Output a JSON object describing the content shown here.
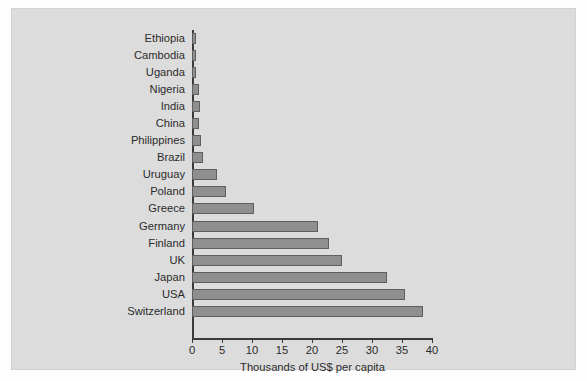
{
  "chart_data": {
    "type": "bar",
    "orientation": "horizontal",
    "title": "",
    "subtitle": "",
    "xlabel": "Thousands of US$ per capita",
    "ylabel": "",
    "xlim": [
      0,
      40
    ],
    "xticks": [
      0,
      5,
      10,
      15,
      20,
      25,
      30,
      35,
      40
    ],
    "xtick_labels": [
      "0",
      "5",
      "10",
      "15",
      "20",
      "25",
      "30",
      "35",
      "40"
    ],
    "grid": false,
    "legend": null,
    "categories": [
      "Ethiopia",
      "Cambodia",
      "Uganda",
      "Nigeria",
      "India",
      "China",
      "Philippines",
      "Brazil",
      "Uruguay",
      "Poland",
      "Greece",
      "Germany",
      "Finland",
      "UK",
      "Japan",
      "USA",
      "Switzerland"
    ],
    "values": [
      0.7,
      0.7,
      0.7,
      1.1,
      1.4,
      1.2,
      1.5,
      1.8,
      4.2,
      5.6,
      10.3,
      21.0,
      22.8,
      25.0,
      32.5,
      35.5,
      38.5
    ],
    "bars": [
      {
        "category": "Ethiopia",
        "value": 0.7
      },
      {
        "category": "Cambodia",
        "value": 0.7
      },
      {
        "category": "Uganda",
        "value": 0.7
      },
      {
        "category": "Nigeria",
        "value": 1.1
      },
      {
        "category": "India",
        "value": 1.4
      },
      {
        "category": "China",
        "value": 1.2
      },
      {
        "category": "Philippines",
        "value": 1.5
      },
      {
        "category": "Brazil",
        "value": 1.8
      },
      {
        "category": "Uruguay",
        "value": 4.2
      },
      {
        "category": "Poland",
        "value": 5.6
      },
      {
        "category": "Greece",
        "value": 10.3
      },
      {
        "category": "Germany",
        "value": 21.0
      },
      {
        "category": "Finland",
        "value": 22.8
      },
      {
        "category": "UK",
        "value": 25.0
      },
      {
        "category": "Japan",
        "value": 32.5
      },
      {
        "category": "USA",
        "value": 35.5
      },
      {
        "category": "Switzerland",
        "value": 38.5
      }
    ]
  },
  "colors": {
    "figure_background": "#dcdcdc",
    "page_background": "#fdfdfd",
    "bar_fill": "#8f8f8f",
    "bar_edge": "#5e5e5e",
    "axis": "#3a3a3a",
    "text": "#2b2b2b"
  }
}
